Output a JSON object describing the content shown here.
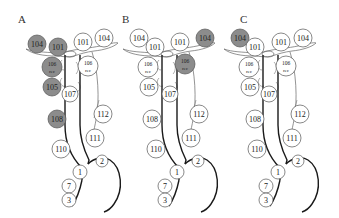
{
  "figure": {
    "colors": {
      "highlight": "#8c8c8c",
      "outline": "#555555",
      "line": "#1a1a1a"
    },
    "panels": [
      {
        "label": "A",
        "nodes": [
          {
            "id": "104L",
            "text": "104",
            "x": 37,
            "y": 44,
            "r": 9,
            "gray": true
          },
          {
            "id": "101L",
            "text": "101",
            "x": 58,
            "y": 47,
            "r": 9,
            "gray": true
          },
          {
            "id": "101R",
            "text": "101",
            "x": 83,
            "y": 42,
            "r": 9,
            "gray": false
          },
          {
            "id": "104R",
            "text": "104",
            "x": 104,
            "y": 38,
            "r": 9,
            "gray": false
          },
          {
            "id": "106L",
            "text": "106",
            "sub": "rec",
            "x": 52,
            "y": 67,
            "r": 10,
            "gray": true
          },
          {
            "id": "106R",
            "text": "106",
            "sub": "rec",
            "x": 88,
            "y": 66,
            "r": 10,
            "gray": false
          },
          {
            "id": "105",
            "text": "105",
            "x": 52,
            "y": 87,
            "r": 9,
            "gray": true
          },
          {
            "id": "107",
            "text": "107",
            "x": 70,
            "y": 94,
            "r": 8,
            "gray": false
          },
          {
            "id": "108",
            "text": "108",
            "x": 57,
            "y": 119,
            "r": 9,
            "gray": true
          },
          {
            "id": "112",
            "text": "112",
            "x": 103,
            "y": 114,
            "r": 9,
            "gray": false
          },
          {
            "id": "111",
            "text": "111",
            "x": 95,
            "y": 138,
            "r": 9,
            "gray": false
          },
          {
            "id": "110",
            "text": "110",
            "x": 61,
            "y": 149,
            "r": 9,
            "gray": false
          },
          {
            "id": "2",
            "text": "2",
            "x": 102,
            "y": 161,
            "r": 6,
            "gray": false
          },
          {
            "id": "1",
            "text": "1",
            "x": 80,
            "y": 172,
            "r": 7,
            "gray": false
          },
          {
            "id": "7",
            "text": "7",
            "x": 69,
            "y": 186,
            "r": 7,
            "gray": false
          },
          {
            "id": "3",
            "text": "3",
            "x": 69,
            "y": 200,
            "r": 7,
            "gray": false
          }
        ]
      },
      {
        "label": "B",
        "nodes": [
          {
            "id": "104L",
            "text": "104",
            "x": 139,
            "y": 38,
            "r": 9,
            "gray": false
          },
          {
            "id": "101L",
            "text": "101",
            "x": 155,
            "y": 47,
            "r": 9,
            "gray": false
          },
          {
            "id": "101R",
            "text": "101",
            "x": 180,
            "y": 42,
            "r": 9,
            "gray": false
          },
          {
            "id": "104R",
            "text": "104",
            "x": 205,
            "y": 38,
            "r": 9,
            "gray": true
          },
          {
            "id": "106L",
            "text": "106",
            "sub": "rec",
            "x": 148,
            "y": 67,
            "r": 10,
            "gray": false
          },
          {
            "id": "106R",
            "text": "106",
            "sub": "rec",
            "x": 185,
            "y": 64,
            "r": 10,
            "gray": true
          },
          {
            "id": "105",
            "text": "105",
            "x": 149,
            "y": 87,
            "r": 9,
            "gray": false
          },
          {
            "id": "107",
            "text": "107",
            "x": 170,
            "y": 94,
            "r": 8,
            "gray": false
          },
          {
            "id": "108",
            "text": "108",
            "x": 152,
            "y": 119,
            "r": 9,
            "gray": false
          },
          {
            "id": "112",
            "text": "112",
            "x": 199,
            "y": 114,
            "r": 9,
            "gray": false
          },
          {
            "id": "111",
            "text": "111",
            "x": 191,
            "y": 138,
            "r": 9,
            "gray": false
          },
          {
            "id": "110",
            "text": "110",
            "x": 156,
            "y": 149,
            "r": 9,
            "gray": false
          },
          {
            "id": "2",
            "text": "2",
            "x": 198,
            "y": 161,
            "r": 6,
            "gray": false
          },
          {
            "id": "1",
            "text": "1",
            "x": 177,
            "y": 172,
            "r": 7,
            "gray": false
          },
          {
            "id": "7",
            "text": "7",
            "x": 165,
            "y": 186,
            "r": 7,
            "gray": false
          },
          {
            "id": "3",
            "text": "3",
            "x": 165,
            "y": 200,
            "r": 7,
            "gray": false
          }
        ]
      },
      {
        "label": "C",
        "nodes": [
          {
            "id": "104L",
            "text": "104",
            "x": 240,
            "y": 38,
            "r": 9,
            "gray": true
          },
          {
            "id": "101L",
            "text": "101",
            "x": 255,
            "y": 47,
            "r": 9,
            "gray": false
          },
          {
            "id": "101R",
            "text": "101",
            "x": 281,
            "y": 42,
            "r": 9,
            "gray": false
          },
          {
            "id": "104R",
            "text": "104",
            "x": 303,
            "y": 38,
            "r": 9,
            "gray": false
          },
          {
            "id": "106L",
            "text": "106",
            "sub": "rec",
            "x": 249,
            "y": 67,
            "r": 10,
            "gray": false
          },
          {
            "id": "106R",
            "text": "106",
            "sub": "rec",
            "x": 286,
            "y": 66,
            "r": 10,
            "gray": false
          },
          {
            "id": "105",
            "text": "105",
            "x": 250,
            "y": 87,
            "r": 9,
            "gray": false
          },
          {
            "id": "107",
            "text": "107",
            "x": 269,
            "y": 94,
            "r": 8,
            "gray": false
          },
          {
            "id": "108",
            "text": "108",
            "x": 255,
            "y": 119,
            "r": 9,
            "gray": false
          },
          {
            "id": "112",
            "text": "112",
            "x": 300,
            "y": 114,
            "r": 9,
            "gray": false
          },
          {
            "id": "111",
            "text": "111",
            "x": 292,
            "y": 138,
            "r": 9,
            "gray": false
          },
          {
            "id": "110",
            "text": "110",
            "x": 257,
            "y": 149,
            "r": 9,
            "gray": false
          },
          {
            "id": "2",
            "text": "2",
            "x": 298,
            "y": 161,
            "r": 6,
            "gray": false
          },
          {
            "id": "1",
            "text": "1",
            "x": 278,
            "y": 172,
            "r": 7,
            "gray": false
          },
          {
            "id": "7",
            "text": "7",
            "x": 266,
            "y": 186,
            "r": 7,
            "gray": false
          },
          {
            "id": "3",
            "text": "3",
            "x": 266,
            "y": 200,
            "r": 7,
            "gray": false
          }
        ]
      }
    ]
  }
}
